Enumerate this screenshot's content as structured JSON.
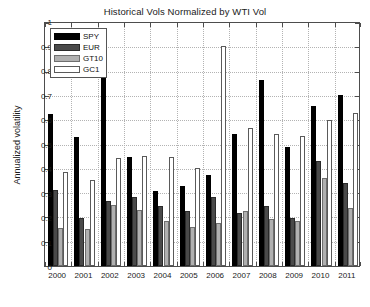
{
  "chart_data": {
    "type": "bar",
    "title": "Historical Vols Normalized by WTI Vol",
    "xlabel": "",
    "ylabel": "Annualized volatility",
    "ylim": [
      0,
      1
    ],
    "ytick_labels": [
      "0",
      "0.1",
      "0.2",
      "0.3",
      "0.4",
      "0.5",
      "0.6",
      "0.7",
      "0.8",
      "0.9",
      "1"
    ],
    "yticks": [
      0,
      0.1,
      0.2,
      0.3,
      0.4,
      0.5,
      0.6,
      0.7,
      0.8,
      0.9,
      1
    ],
    "grid": true,
    "legend_position": "upper left",
    "categories": [
      "2000",
      "2001",
      "2002",
      "2003",
      "2004",
      "2005",
      "2006",
      "2007",
      "2008",
      "2009",
      "2010",
      "2011"
    ],
    "series": [
      {
        "name": "SPY",
        "color": "#000000",
        "values": [
          0.62,
          0.525,
          0.79,
          0.445,
          0.305,
          0.325,
          0.37,
          0.54,
          0.76,
          0.485,
          0.655,
          0.7
        ]
      },
      {
        "name": "EUR",
        "color": "#4a4a4a",
        "values": [
          0.31,
          0.195,
          0.265,
          0.28,
          0.245,
          0.225,
          0.28,
          0.215,
          0.245,
          0.195,
          0.43,
          0.34
        ]
      },
      {
        "name": "GT10",
        "color": "#b0b0b0",
        "values": [
          0.155,
          0.15,
          0.25,
          0.23,
          0.185,
          0.16,
          0.175,
          0.225,
          0.19,
          0.185,
          0.36,
          0.235
        ]
      },
      {
        "name": "GC1",
        "color": "#ffffff",
        "values": [
          0.385,
          0.35,
          0.44,
          0.45,
          0.445,
          0.4,
          0.9,
          0.565,
          0.54,
          0.53,
          0.595,
          0.625
        ]
      }
    ]
  },
  "axes": {
    "frame_color": "#4d4d4d",
    "grid_color": "#b3b3b3"
  }
}
